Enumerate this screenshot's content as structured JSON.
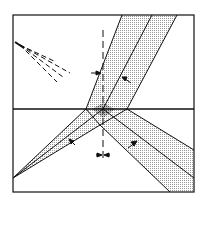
{
  "figure": {
    "caption": "(a)",
    "media": {
      "upper_label_base": "n",
      "upper_label_sub": "1",
      "lower_label_base": "n",
      "lower_label_sub": "2"
    },
    "angles": {
      "phi_label": "φ",
      "theta_left_label": "θ",
      "theta_right_label": "θ"
    },
    "colors": {
      "line": "#111111",
      "background": "#ffffff",
      "beam_fill": "#c8c8c8",
      "beam_overlap_fill": "#8a8a8a"
    }
  }
}
